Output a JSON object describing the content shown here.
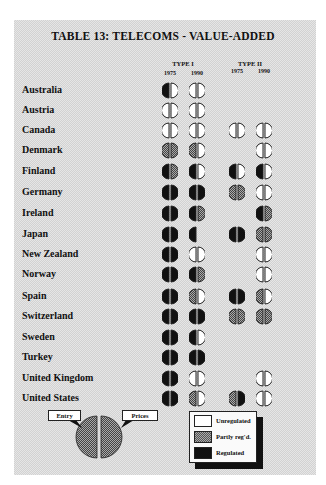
{
  "title": "TABLE 13: TELECOMS - VALUE-ADDED",
  "column_groups": [
    {
      "label": "TYPE I",
      "years": [
        "1975",
        "1990"
      ]
    },
    {
      "label": "TYPE II",
      "years": [
        "1975",
        "1990"
      ]
    }
  ],
  "states": {
    "U": "Unregulated",
    "P": "Partly reg'd.",
    "R": "Regulated",
    "N": "Not shown"
  },
  "rows": [
    {
      "country": "Australia",
      "cells": [
        [
          "R",
          "U"
        ],
        [
          "U",
          "U"
        ],
        null,
        null
      ]
    },
    {
      "country": "Austria",
      "cells": [
        [
          "U",
          "U"
        ],
        [
          "U",
          "U"
        ],
        null,
        null
      ]
    },
    {
      "country": "Canada",
      "cells": [
        [
          "U",
          "U"
        ],
        [
          "U",
          "U"
        ],
        [
          "U",
          "U"
        ],
        [
          "U",
          "U"
        ]
      ]
    },
    {
      "country": "Denmark",
      "cells": [
        [
          "P",
          "P"
        ],
        [
          "P",
          "U"
        ],
        null,
        [
          "U",
          "U"
        ]
      ]
    },
    {
      "country": "Finland",
      "cells": [
        [
          "R",
          "P"
        ],
        [
          "R",
          "U"
        ],
        [
          "R",
          "U"
        ],
        [
          "R",
          "U"
        ]
      ]
    },
    {
      "country": "Germany",
      "cells": [
        [
          "R",
          "R"
        ],
        [
          "R",
          "R"
        ],
        [
          "P",
          "P"
        ],
        [
          "U",
          "U"
        ]
      ]
    },
    {
      "country": "Ireland",
      "cells": [
        [
          "R",
          "R"
        ],
        [
          "R",
          "P"
        ],
        null,
        [
          "R",
          "P"
        ]
      ]
    },
    {
      "country": "Japan",
      "cells": [
        [
          "R",
          "R"
        ],
        [
          "R",
          "N"
        ],
        [
          "R",
          "R"
        ],
        [
          "P",
          "P"
        ]
      ]
    },
    {
      "country": "New Zealand",
      "cells": [
        [
          "R",
          "R"
        ],
        [
          "U",
          "U"
        ],
        null,
        [
          "U",
          "U"
        ]
      ]
    },
    {
      "country": "Norway",
      "cells": [
        [
          "R",
          "R"
        ],
        [
          "R",
          "P"
        ],
        null,
        [
          "U",
          "U"
        ]
      ]
    },
    {
      "country": "Spain",
      "cells": [
        [
          "R",
          "R"
        ],
        [
          "P",
          "U"
        ],
        [
          "R",
          "R"
        ],
        [
          "P",
          "U"
        ]
      ]
    },
    {
      "country": "Switzerland",
      "cells": [
        [
          "R",
          "R"
        ],
        [
          "R",
          "R"
        ],
        [
          "P",
          "P"
        ],
        [
          "P",
          "P"
        ]
      ]
    },
    {
      "country": "Sweden",
      "cells": [
        [
          "R",
          "R"
        ],
        [
          "R",
          "U"
        ],
        null,
        null
      ]
    },
    {
      "country": "Turkey",
      "cells": [
        [
          "R",
          "R"
        ],
        [
          "R",
          "R"
        ],
        null,
        null
      ]
    },
    {
      "country": "United Kingdom",
      "cells": [
        [
          "R",
          "R"
        ],
        [
          "U",
          "U"
        ],
        null,
        [
          "U",
          "U"
        ]
      ]
    },
    {
      "country": "United States",
      "cells": [
        [
          "R",
          "R"
        ],
        [
          "P",
          "U"
        ],
        [
          "P",
          "R"
        ],
        [
          "U",
          "U"
        ]
      ]
    }
  ],
  "key": {
    "left_label": "Entry",
    "right_label": "Prices"
  },
  "legend": [
    {
      "label": "Unregulated",
      "swatch": "white"
    },
    {
      "label": "Partly reg'd.",
      "swatch": "hatch"
    },
    {
      "label": "Regulated",
      "swatch": "black"
    }
  ]
}
